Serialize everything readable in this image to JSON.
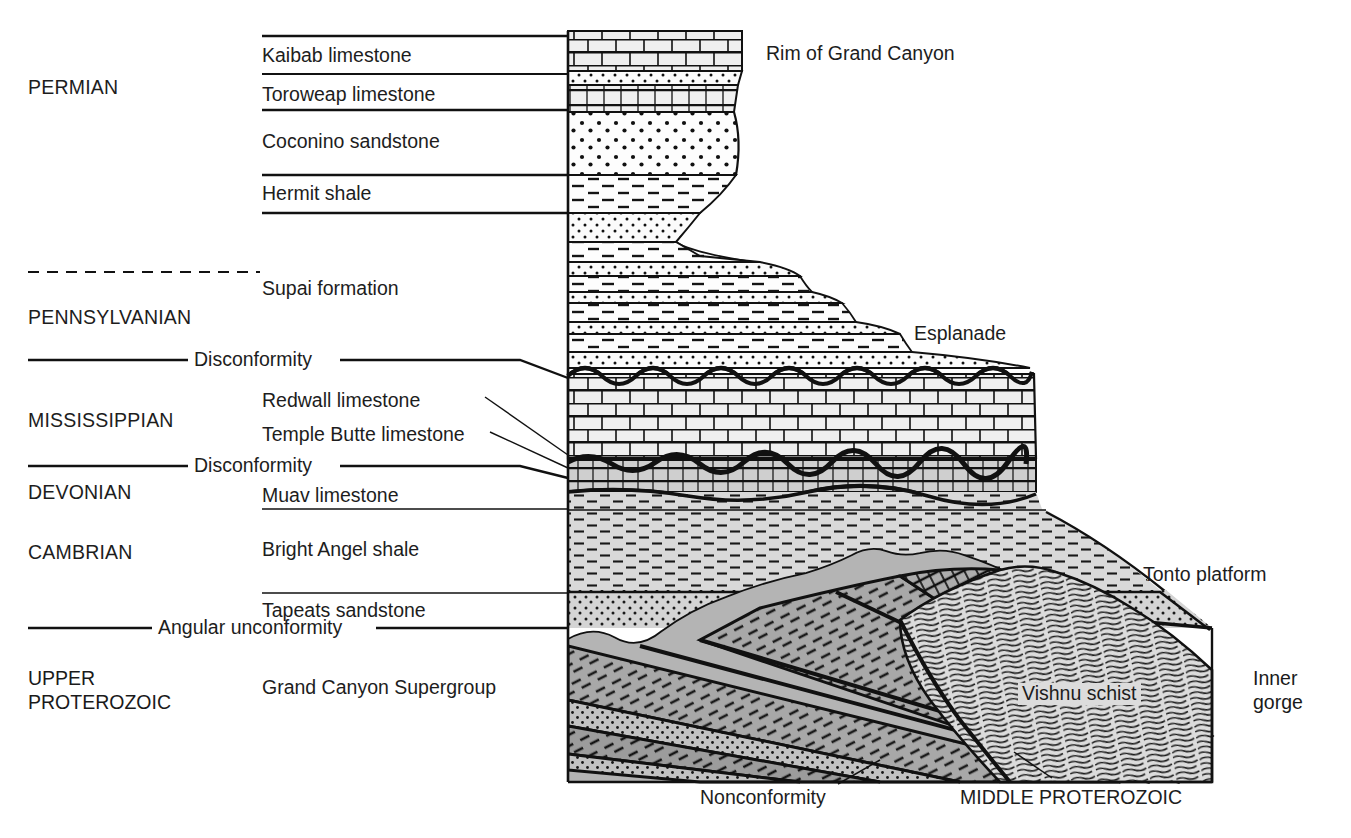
{
  "figure": {
    "kind": "geologic-cross-section",
    "colors": {
      "ink": "#1a1a1a",
      "paper": "#ffffff",
      "limestone_fill": "#ececec",
      "muav_fill": "#cfcfcf",
      "shale_fill": "#d8d8d8",
      "tapeats_fill": "#d2d2d2",
      "supergroup_dark": "#9a9a9a",
      "supergroup_mid": "#b0b0b0",
      "supergroup_light": "#c4c4c4",
      "schist_fill": "#d9d9d9"
    }
  },
  "eras": [
    {
      "id": "permian",
      "label": "PERMIAN",
      "x": 28,
      "y": 78
    },
    {
      "id": "pennsylvanian",
      "label": "PENNSYLVANIAN",
      "x": 28,
      "y": 308
    },
    {
      "id": "mississippian",
      "label": "MISSISSIPPIAN",
      "x": 28,
      "y": 411
    },
    {
      "id": "devonian",
      "label": "DEVONIAN",
      "x": 28,
      "y": 483
    },
    {
      "id": "cambrian",
      "label": "CAMBRIAN",
      "x": 28,
      "y": 543
    },
    {
      "id": "upper-proterozoic",
      "label": "UPPER\nPROTEROZOIC",
      "x": 28,
      "y": 676
    }
  ],
  "formations": [
    {
      "id": "kaibab",
      "label": "Kaibab limestone",
      "x": 262,
      "y": 46,
      "leader_top": 36,
      "leader_bottom": 74,
      "rock": "limestone"
    },
    {
      "id": "toroweap",
      "label": "Toroweap limestone",
      "x": 262,
      "y": 85,
      "leader_top": 74,
      "leader_bottom": 110,
      "rock": "limestone"
    },
    {
      "id": "coconino",
      "label": "Coconino sandstone",
      "x": 262,
      "y": 132,
      "leader_top": 110,
      "leader_bottom": 175,
      "rock": "sandstone"
    },
    {
      "id": "hermit",
      "label": "Hermit shale",
      "x": 262,
      "y": 184,
      "leader_top": 175,
      "leader_bottom": 213,
      "rock": "shale"
    },
    {
      "id": "supai",
      "label": "Supai formation",
      "x": 262,
      "y": 279,
      "leader_top": null,
      "leader_bottom": null,
      "rock": "interbedded"
    },
    {
      "id": "redwall",
      "label": "Redwall limestone",
      "x": 262,
      "y": 391,
      "leader_top": null,
      "leader_bottom": null,
      "rock": "limestone"
    },
    {
      "id": "temple-butte",
      "label": "Temple Butte limestone",
      "x": 262,
      "y": 425,
      "leader_top": null,
      "leader_bottom": null,
      "rock": "limestone"
    },
    {
      "id": "muav",
      "label": "Muav limestone",
      "x": 262,
      "y": 486,
      "leader_top": null,
      "leader_bottom": 509,
      "rock": "limestone"
    },
    {
      "id": "bright-angel",
      "label": "Bright Angel shale",
      "x": 262,
      "y": 540,
      "leader_top": null,
      "leader_bottom": 593,
      "rock": "shale"
    },
    {
      "id": "tapeats",
      "label": "Tapeats sandstone",
      "x": 262,
      "y": 601,
      "leader_top": 593,
      "leader_bottom": null,
      "rock": "sandstone"
    },
    {
      "id": "grand-canyon-supergroup",
      "label": "Grand Canyon Supergroup",
      "x": 262,
      "y": 678,
      "leader_top": null,
      "leader_bottom": null,
      "rock": "tilted-strata"
    }
  ],
  "unconformities": [
    {
      "id": "disconformity-1",
      "label": "Disconformity",
      "y": 360,
      "left_from": 28,
      "left_to": 188,
      "right_from": 340,
      "right_to": 568
    },
    {
      "id": "disconformity-2",
      "label": "Disconformity",
      "y": 466,
      "left_from": 28,
      "left_to": 188,
      "right_from": 340,
      "right_to": 568
    },
    {
      "id": "angular-unconformity",
      "label": "Angular unconformity",
      "y": 628,
      "left_from": 28,
      "left_to": 152,
      "right_from": 376,
      "right_to": 568
    },
    {
      "id": "nonconformity",
      "label": "Nonconformity",
      "x": 700,
      "y": 790
    }
  ],
  "boundary_dashed": {
    "id": "permian-pennsylvanian-boundary",
    "y": 272,
    "from": 28,
    "to": 260
  },
  "features": [
    {
      "id": "rim-of-grand-canyon",
      "label": "Rim of Grand Canyon",
      "x": 766,
      "y": 44
    },
    {
      "id": "esplanade",
      "label": "Esplanade",
      "x": 914,
      "y": 324
    },
    {
      "id": "tonto-platform",
      "label": "Tonto platform",
      "x": 1143,
      "y": 565
    },
    {
      "id": "inner-gorge",
      "label": "Inner\ngorge",
      "x": 1253,
      "y": 676
    },
    {
      "id": "vishnu-schist",
      "label": "Vishnu schist",
      "x": 1018,
      "y": 683
    },
    {
      "id": "middle-proterozoic",
      "label": "MIDDLE PROTEROZOIC",
      "x": 960,
      "y": 790
    }
  ]
}
